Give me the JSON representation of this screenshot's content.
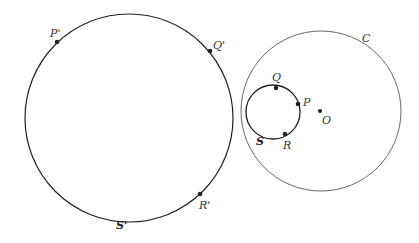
{
  "diagram": {
    "circles": [
      {
        "id": "S_prime",
        "label": "S'",
        "cx": 129,
        "cy": 118,
        "r": 104,
        "stroke": "#222222",
        "width": 1.2
      },
      {
        "id": "C",
        "label": "C",
        "cx": 321,
        "cy": 111,
        "r": 80,
        "stroke": "#555555",
        "width": 0.9
      },
      {
        "id": "S",
        "label": "S",
        "cx": 273,
        "cy": 112,
        "r": 27,
        "stroke": "#222222",
        "width": 1.3
      }
    ],
    "points": [
      {
        "label": "P'",
        "x": 57,
        "y": 42
      },
      {
        "label": "Q'",
        "x": 210,
        "y": 51
      },
      {
        "label": "R'",
        "x": 200,
        "y": 194
      },
      {
        "label": "Q",
        "x": 276,
        "y": 88
      },
      {
        "label": "P",
        "x": 298,
        "y": 104
      },
      {
        "label": "R",
        "x": 285,
        "y": 134
      },
      {
        "label": "O",
        "x": 320,
        "y": 111
      }
    ],
    "labels": {
      "P_prime": "P'",
      "Q_prime": "Q'",
      "R_prime": "R'",
      "S_prime": "S'",
      "C": "C",
      "Q": "Q",
      "P": "P",
      "R": "R",
      "S": "S",
      "O": "O"
    }
  }
}
